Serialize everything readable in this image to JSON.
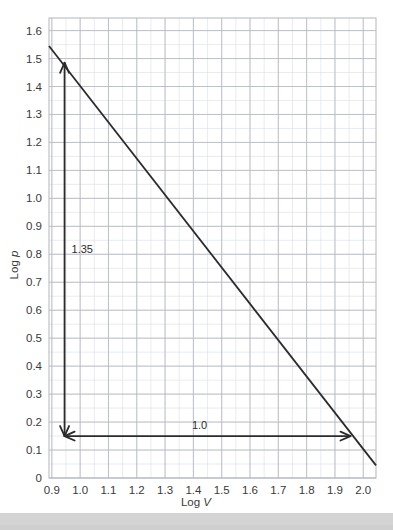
{
  "chart_data": {
    "type": "line",
    "title": "",
    "xlabel": "Log V",
    "ylabel": "Log p",
    "xlabel_prefix": "Log ",
    "xlabel_symbol": "V",
    "ylabel_prefix": "Log ",
    "ylabel_symbol": "p",
    "xlim": [
      0.89,
      2.045
    ],
    "ylim": [
      0.0,
      1.645
    ],
    "xticks": [
      "0.9",
      "1.0",
      "1.1",
      "1.2",
      "1.3",
      "1.4",
      "1.5",
      "1.6",
      "1.7",
      "1.8",
      "1.9",
      "2.0"
    ],
    "xtick_values": [
      0.9,
      1.0,
      1.1,
      1.2,
      1.3,
      1.4,
      1.5,
      1.6,
      1.7,
      1.8,
      1.9,
      2.0
    ],
    "yticks": [
      "0",
      "0.1",
      "0.2",
      "0.3",
      "0.4",
      "0.5",
      "0.6",
      "0.7",
      "0.8",
      "0.9",
      "1.0",
      "1.1",
      "1.2",
      "1.3",
      "1.4",
      "1.5",
      "1.6"
    ],
    "ytick_values": [
      0,
      0.1,
      0.2,
      0.3,
      0.4,
      0.5,
      0.6,
      0.7,
      0.8,
      0.9,
      1.0,
      1.1,
      1.2,
      1.3,
      1.4,
      1.5,
      1.6
    ],
    "grid": true,
    "minor_grid": true,
    "minor_grid_step": 0.05,
    "legend": "none",
    "series": [
      {
        "name": "log p vs log V",
        "kind": "line",
        "color": "#2b2b2b",
        "x": [
          0.89,
          2.045
        ],
        "y": [
          1.545,
          0.045
        ],
        "slope": -1.3,
        "intercept": 2.702
      }
    ],
    "annotations": [
      {
        "name": "vertical-rise-arrow",
        "label": "1.35",
        "kind": "arrow",
        "orientation": "vertical",
        "x": 0.945,
        "y_start": 0.15,
        "y_end": 1.485,
        "value": 1.35,
        "double_headed": true,
        "color": "#2b2b2b"
      },
      {
        "name": "horizontal-run-arrow",
        "label": "1.0",
        "kind": "arrow",
        "orientation": "horizontal",
        "y": 0.15,
        "x_start": 0.945,
        "x_end": 1.955,
        "value": 1.0,
        "double_headed": true,
        "color": "#2b2b2b"
      }
    ]
  },
  "colors": {
    "background": "#ffffff",
    "plot_background": "#ffffff",
    "major_grid": "#b8bcc4",
    "minor_grid": "#dfe2e6",
    "line": "#2b2b2b",
    "text": "#3a3a3a",
    "footer": "#d4d4d4"
  }
}
